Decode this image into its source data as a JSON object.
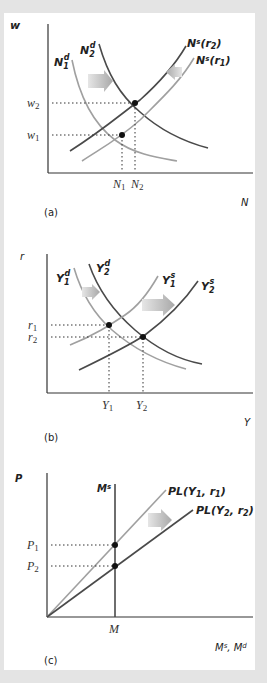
{
  "colors": {
    "background": "#e4e4e4",
    "panel": "#ffffff",
    "axis": "#333333",
    "dark_curve": "#4a4a4a",
    "light_curve": "#a0a0a0",
    "arrow": "#b5b5b5",
    "dot": "#111111"
  },
  "panels": [
    {
      "id": "a",
      "caption": "(a)",
      "y_axis_label": "w",
      "x_axis_label": "N",
      "curves": [
        {
          "label_main": "N",
          "label_sub": "1",
          "label_sup": "d",
          "style": "light",
          "kind": "labor demand (initial)"
        },
        {
          "label_main": "N",
          "label_sub": "2",
          "label_sup": "d",
          "style": "dark",
          "kind": "labor demand (new)"
        },
        {
          "label": "Ns(r2)",
          "label_main": "N",
          "label_sup": "s",
          "label_arg": "(r",
          "label_arg_sub": "2",
          "label_close": ")",
          "style": "dark",
          "kind": "labor supply (new)"
        },
        {
          "label": "Ns(r1)",
          "label_main": "N",
          "label_sup": "s",
          "label_arg": "(r",
          "label_arg_sub": "1",
          "label_close": ")",
          "style": "light",
          "kind": "labor supply (initial)"
        }
      ],
      "y_ticks": [
        {
          "main": "w",
          "sub": "2"
        },
        {
          "main": "w",
          "sub": "1"
        }
      ],
      "x_ticks": [
        {
          "main": "N",
          "sub": "1"
        },
        {
          "main": "N",
          "sub": "2"
        }
      ],
      "shifts": [
        "demand shifts right",
        "supply shifts left"
      ]
    },
    {
      "id": "b",
      "caption": "(b)",
      "y_axis_label": "r",
      "x_axis_label": "Y",
      "curves": [
        {
          "label_main": "Y",
          "label_sub": "1",
          "label_sup": "d",
          "style": "light"
        },
        {
          "label_main": "Y",
          "label_sub": "2",
          "label_sup": "d",
          "style": "dark"
        },
        {
          "label_main": "Y",
          "label_sub": "1",
          "label_sup": "s",
          "style": "light"
        },
        {
          "label_main": "Y",
          "label_sub": "2",
          "label_sup": "s",
          "style": "dark"
        }
      ],
      "y_ticks": [
        {
          "main": "r",
          "sub": "1"
        },
        {
          "main": "r",
          "sub": "2"
        }
      ],
      "x_ticks": [
        {
          "main": "Y",
          "sub": "1"
        },
        {
          "main": "Y",
          "sub": "2"
        }
      ],
      "shifts": [
        "demand shifts right",
        "supply shifts right"
      ]
    },
    {
      "id": "c",
      "caption": "(c)",
      "y_axis_label": "P",
      "x_axis_label": "Ms, Md",
      "money_supply_label": {
        "main": "M",
        "sup": "s"
      },
      "curves": [
        {
          "label": "PL(Y1, r1)",
          "pre": "PL(Y",
          "sub1": "1",
          "mid": ", r",
          "sub2": "1",
          "post": ")",
          "style": "light"
        },
        {
          "label": "PL(Y2, r2)",
          "pre": "PL(Y",
          "sub1": "2",
          "mid": ", r",
          "sub2": "2",
          "post": ")",
          "style": "dark"
        }
      ],
      "y_ticks": [
        {
          "main": "P",
          "sub": "1"
        },
        {
          "main": "P",
          "sub": "2"
        }
      ],
      "x_ticks": [
        {
          "main": "M"
        }
      ],
      "x_axis_label_parts": {
        "m1": "M",
        "s": "s",
        "comma": ", ",
        "m2": "M",
        "d": "d"
      }
    }
  ]
}
